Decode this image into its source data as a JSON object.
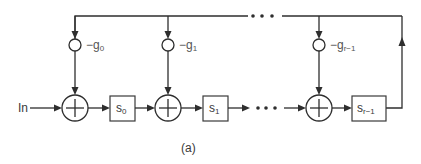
{
  "diagram": {
    "type": "block-diagram",
    "input_label": "In",
    "caption": "(a)",
    "stroke_color": "#2e2e2e",
    "gains": [
      {
        "sign": "−",
        "base": "g",
        "sub": "0"
      },
      {
        "sign": "−",
        "base": "g",
        "sub": "1"
      },
      {
        "sign": "−",
        "base": "g",
        "sub": "r−1"
      }
    ],
    "registers": [
      {
        "base": "s",
        "sub": "0"
      },
      {
        "base": "s",
        "sub": "1"
      },
      {
        "base": "s",
        "sub": "r−1"
      }
    ],
    "adders": 3,
    "ellipsis": "• • •"
  }
}
